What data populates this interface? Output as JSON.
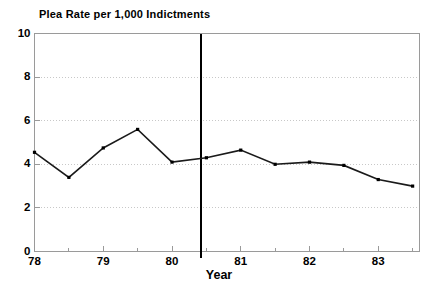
{
  "chart_data": {
    "type": "line",
    "title": "Plea Rate per 1,000 Indictments",
    "xlabel": "Year",
    "ylabel": "",
    "xlim": [
      78.0,
      83.6
    ],
    "ylim": [
      0,
      10
    ],
    "grid": true,
    "legend": null,
    "x": [
      78.0,
      78.5,
      79.0,
      79.5,
      80.0,
      80.5,
      81.0,
      81.5,
      82.0,
      82.5,
      83.0,
      83.5
    ],
    "values": [
      4.55,
      3.4,
      4.75,
      5.6,
      4.1,
      4.3,
      4.65,
      4.0,
      4.1,
      3.95,
      3.3,
      3.0
    ],
    "series": [
      {
        "name": "Plea Rate per 1,000 Indictments",
        "values": [
          4.55,
          3.4,
          4.75,
          5.6,
          4.1,
          4.3,
          4.65,
          4.0,
          4.1,
          3.95,
          3.3,
          3.0
        ]
      }
    ],
    "ytick_labels": [
      "0",
      "2",
      "4",
      "6",
      "8",
      "10"
    ],
    "ytick_values": [
      0,
      2,
      4,
      6,
      8,
      10
    ],
    "xtick_labels": [
      "78",
      "79",
      "80",
      "81",
      "82",
      "83"
    ],
    "xtick_values": [
      78,
      79,
      80,
      81,
      82,
      83
    ],
    "xminor_values": [
      78.5,
      79.5,
      80.5,
      81.5,
      82.5,
      83.5
    ],
    "annotations": [
      {
        "name": "intervention-line",
        "type": "vline",
        "x": 80.42,
        "label": ""
      }
    ],
    "colors": {
      "line": "#1a1a1a",
      "marker": "#000000",
      "frame": "#9a9a9a",
      "grid": "#c8c8c8",
      "vline": "#000000",
      "background": "#ffffff",
      "text": "#000000"
    }
  }
}
